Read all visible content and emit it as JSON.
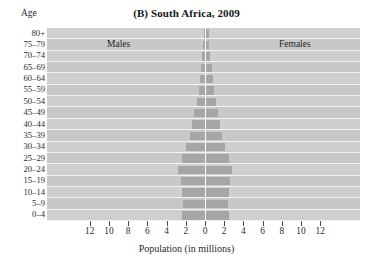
{
  "figure": {
    "panel_tag": "(B)",
    "title": "(B) South Africa, 2009",
    "title_text_only": "South Africa, 2009",
    "age_axis_header": "Age",
    "xaxis_title": "Population (in millions)",
    "males_label": "Males",
    "females_label": "Females",
    "plot_background_color": "#cfcfcf",
    "bar_color": "#a6a6a6",
    "gridline_color": "#f2f2f2",
    "centerline_color": "#fdfdfd"
  },
  "chart_data": {
    "type": "bar",
    "subtype": "population-pyramid",
    "title": "(B) South Africa, 2009",
    "xlabel": "Population (in millions)",
    "ylabel": "Age",
    "orientation": "horizontal",
    "grid": true,
    "legend_position": "in-plot",
    "categories": [
      "80+",
      "75–79",
      "70–74",
      "65–69",
      "60–64",
      "55–59",
      "50–54",
      "45–49",
      "40–44",
      "35–39",
      "30–34",
      "25–29",
      "20–24",
      "15–19",
      "10–14",
      "5–9",
      "0–4"
    ],
    "xlim": [
      -13,
      13
    ],
    "xticks": [
      12,
      10,
      8,
      6,
      4,
      2,
      0,
      2,
      4,
      6,
      8,
      10,
      12
    ],
    "xtick_values_signed": [
      -12,
      -10,
      -8,
      -6,
      -4,
      -2,
      0,
      2,
      4,
      6,
      8,
      10,
      12
    ],
    "series": [
      {
        "name": "Males",
        "side": "left",
        "values": [
          0.15,
          0.19,
          0.28,
          0.4,
          0.52,
          0.66,
          0.86,
          1.1,
          1.35,
          1.6,
          1.95,
          2.4,
          2.8,
          2.55,
          2.4,
          2.3,
          2.35
        ]
      },
      {
        "name": "Females",
        "side": "right",
        "values": [
          0.3,
          0.3,
          0.42,
          0.58,
          0.72,
          0.88,
          1.05,
          1.25,
          1.5,
          1.7,
          2.0,
          2.4,
          2.7,
          2.5,
          2.4,
          2.3,
          2.35
        ]
      }
    ]
  }
}
